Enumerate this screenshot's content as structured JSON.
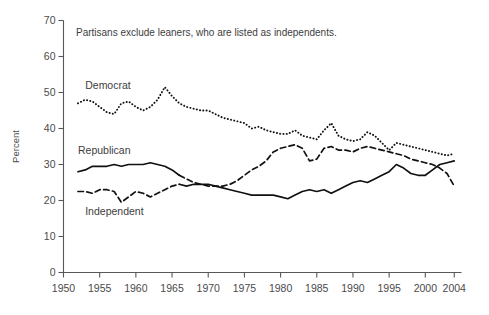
{
  "chart_data": {
    "type": "line",
    "title": "",
    "annotation": "Partisans exclude leaners, who are listed as independents.",
    "xlabel": "",
    "ylabel": "Percent",
    "xlim": [
      1950,
      2005
    ],
    "ylim": [
      0,
      70
    ],
    "yticks": [
      0,
      10,
      20,
      30,
      40,
      50,
      60,
      70
    ],
    "xticks": [
      1950,
      1955,
      1960,
      1965,
      1970,
      1975,
      1980,
      1985,
      1990,
      1995,
      2000,
      2004
    ],
    "grid": false,
    "legend_position": "inline-labels",
    "x": [
      1952,
      1953,
      1954,
      1955,
      1956,
      1957,
      1958,
      1959,
      1960,
      1961,
      1962,
      1963,
      1964,
      1965,
      1966,
      1967,
      1968,
      1969,
      1970,
      1971,
      1972,
      1973,
      1974,
      1975,
      1976,
      1977,
      1978,
      1979,
      1980,
      1981,
      1982,
      1983,
      1984,
      1985,
      1986,
      1987,
      1988,
      1989,
      1990,
      1991,
      1992,
      1993,
      1994,
      1995,
      1996,
      1997,
      1998,
      1999,
      2000,
      2001,
      2002,
      2003,
      2004
    ],
    "series": [
      {
        "name": "Democrat",
        "style": "dotted",
        "label_x": 1953,
        "label_y": 51,
        "values": [
          47.0,
          48.0,
          47.5,
          46.0,
          44.5,
          44.0,
          47.0,
          47.5,
          46.0,
          45.0,
          46.0,
          48.0,
          51.5,
          49.0,
          47.0,
          46.0,
          45.5,
          45.0,
          45.0,
          44.0,
          43.0,
          42.5,
          42.0,
          41.5,
          40.0,
          40.5,
          39.5,
          39.0,
          38.5,
          38.5,
          39.5,
          38.0,
          37.5,
          37.0,
          39.5,
          41.5,
          38.0,
          37.0,
          36.5,
          37.0,
          39.0,
          38.0,
          36.0,
          34.0,
          36.0,
          35.5,
          35.0,
          34.5,
          34.0,
          33.5,
          33.0,
          32.5,
          33.0
        ]
      },
      {
        "name": "Republican",
        "style": "solid-then-dashed",
        "label_x": 1952,
        "label_y": 33,
        "values": [
          28.0,
          28.5,
          29.5,
          29.5,
          29.5,
          30.0,
          29.5,
          30.0,
          30.0,
          30.0,
          30.5,
          30.0,
          29.5,
          28.5,
          27.0,
          26.0,
          25.0,
          24.5,
          24.0,
          24.0,
          24.0,
          24.5,
          25.5,
          27.0,
          28.5,
          29.5,
          31.0,
          33.5,
          34.5,
          35.0,
          35.5,
          34.5,
          31.0,
          31.5,
          34.5,
          35.0,
          34.0,
          34.0,
          33.5,
          34.5,
          35.0,
          34.5,
          34.0,
          33.5,
          33.0,
          32.5,
          31.5,
          31.0,
          30.5,
          30.0,
          29.0,
          27.5,
          24.0
        ]
      },
      {
        "name": "Independent",
        "style": "solid",
        "label_x": 1953,
        "label_y": 16,
        "values": [
          22.5,
          22.5,
          22.0,
          23.0,
          23.0,
          22.5,
          19.5,
          21.0,
          22.5,
          22.0,
          21.0,
          22.0,
          23.0,
          24.0,
          24.5,
          24.0,
          24.5,
          24.5,
          24.5,
          24.0,
          23.5,
          23.0,
          22.5,
          22.0,
          21.5,
          21.5,
          21.5,
          21.5,
          21.0,
          20.5,
          21.5,
          22.5,
          23.0,
          22.5,
          23.0,
          22.0,
          23.0,
          24.0,
          25.0,
          25.5,
          25.0,
          26.0,
          27.0,
          28.0,
          30.0,
          29.0,
          27.5,
          27.0,
          27.0,
          28.5,
          30.0,
          30.5,
          31.0
        ]
      }
    ]
  }
}
